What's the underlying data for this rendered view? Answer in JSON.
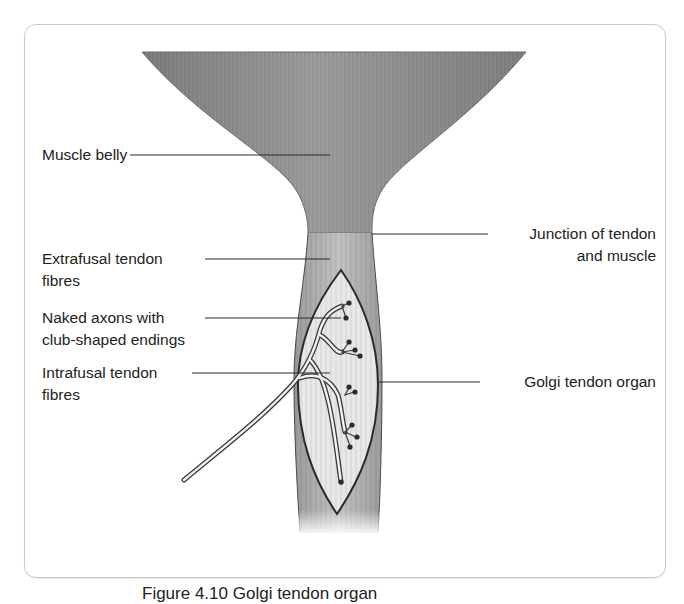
{
  "figure": {
    "labels": {
      "muscle_belly": "Muscle belly",
      "extrafusal_line1": "Extrafusal tendon",
      "extrafusal_line2": "fibres",
      "naked_axons_line1": "Naked axons with",
      "naked_axons_line2": "club-shaped endings",
      "intrafusal_line1": "Intrafusal tendon",
      "intrafusal_line2": "fibres",
      "junction_line1": "Junction of tendon",
      "junction_line2": "and muscle",
      "golgi": "Golgi tendon organ"
    },
    "caption": "Figure 4.10  Golgi tendon organ",
    "colors": {
      "muscle": "#8f8f8f",
      "tendon": "#b4b4b4",
      "organ": "#e6e6e6",
      "outline": "#2b2b2b",
      "frame": "#c9c9c9",
      "text": "#222222"
    }
  }
}
